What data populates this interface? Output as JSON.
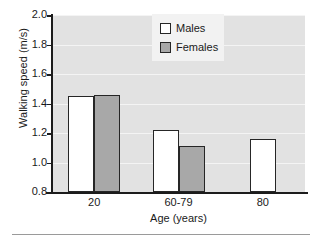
{
  "chart_data": {
    "type": "bar",
    "title": "",
    "xlabel": "Age (years)",
    "ylabel": "Walking speed (m/s)",
    "categories": [
      "20",
      "60-79",
      "80"
    ],
    "series": [
      {
        "name": "Males",
        "values": [
          1.45,
          1.22,
          1.16
        ],
        "color": "#ffffff"
      },
      {
        "name": "Females",
        "values": [
          1.46,
          1.11,
          null
        ],
        "color": "#a8a8a8"
      }
    ],
    "ylim": [
      0.8,
      2.0
    ],
    "yticks": [
      "2.0",
      "1.8",
      "1.6",
      "1.4",
      "1.2",
      "1.0",
      "0.8"
    ],
    "ytick_values": [
      2.0,
      1.8,
      1.6,
      1.4,
      1.2,
      1.0,
      0.8
    ],
    "grid": true,
    "grid_axis": "y",
    "legend_position": "top-center",
    "legend_entries": [
      "Males",
      "Females"
    ],
    "plot_background": "#e2e2e2",
    "gridline_color": "#f4f4f4",
    "bar_edge_color": "#262626"
  }
}
